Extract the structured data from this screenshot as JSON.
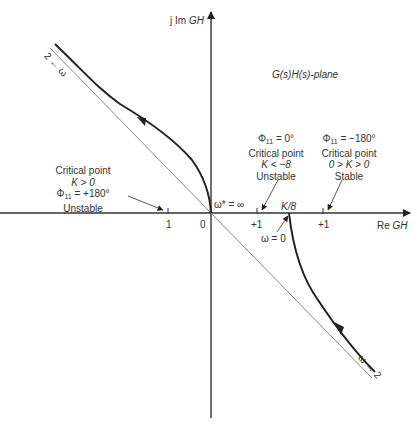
{
  "axes": {
    "y_label_prefix": "j Im ",
    "y_label_var": "GH",
    "x_label_prefix": "Re ",
    "x_label_var": "GH",
    "origin_label": "0"
  },
  "plane_title": "G(s)H(s)-plane",
  "tick_labels": {
    "neg_one": "1",
    "pos_one_a": "+1",
    "pos_one_b": "+1"
  },
  "curve_labels": {
    "omega_inf_origin": "ω* = ∞",
    "k_over_8": "K/8",
    "omega_zero": "ω = 0",
    "omega_to_2_upper": "2 ← ω",
    "omega_to_2_lower": "ω → 2"
  },
  "annotations": {
    "left": {
      "line1": "Critical point",
      "line2": "K > 0",
      "line3_phi": "Φ",
      "line3_sub": "11",
      "line3_rest": " = +180°",
      "line4": "Unstable"
    },
    "middle": {
      "line1_phi": "Φ",
      "line1_sub": "11",
      "line1_rest": " = 0°",
      "line2": "Critical point",
      "line3": "K < −8",
      "line4": "Unstable"
    },
    "right": {
      "line1_phi": "Φ",
      "line1_sub": "11",
      "line1_rest": " = −180°",
      "line2": "Critical point",
      "line3": "0 > K > 0",
      "line4": "Stable"
    }
  }
}
